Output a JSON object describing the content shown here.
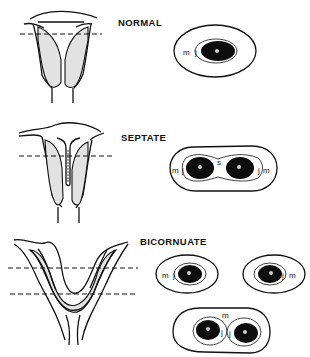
{
  "figure": {
    "panels": [
      {
        "id": "normal",
        "title": "NORMAL",
        "cross_sections": [
          {
            "labels": [
              "m",
              "j",
              "e"
            ]
          }
        ]
      },
      {
        "id": "septate",
        "title": "SEPTATE",
        "cross_sections": [
          {
            "labels": [
              "m",
              "j",
              "e",
              "s",
              "e",
              "j",
              "m"
            ]
          }
        ]
      },
      {
        "id": "bicornuate",
        "title": "BICORNUATE",
        "cross_sections": [
          {
            "labels": [
              "m",
              "j",
              "e"
            ]
          },
          {
            "labels": [
              "e",
              "j",
              "m"
            ]
          },
          {
            "labels": [
              "m",
              "j",
              "e",
              "j",
              "e"
            ]
          }
        ]
      }
    ],
    "legend_letters": {
      "m": "m",
      "j": "j",
      "e": "e",
      "s": "s"
    }
  },
  "colors": {
    "line": "#111111",
    "shade": "#e2e2e2",
    "cavity": "#0d0d0d",
    "background": "#ffffff"
  }
}
